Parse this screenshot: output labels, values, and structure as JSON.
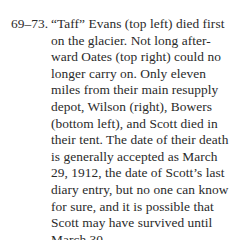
{
  "caption": {
    "number": "69–73.",
    "lines": [
      "“Taff” Evans (top left) died first",
      "on the glacier. Not long after-",
      "ward Oates (top right) could no",
      "longer carry on. Only eleven",
      "miles from their main resupply",
      "depot, Wilson (right), Bowers",
      "(bottom left), and Scott died in",
      "their tent. The date of their death",
      "is generally accepted as March",
      "29, 1912, the date of Scott’s last",
      "diary entry, but no one can know",
      "for sure, and it is possible that",
      "Scott may have survived until",
      "March 30."
    ]
  }
}
